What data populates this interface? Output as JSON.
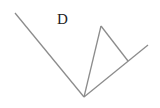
{
  "diagram": {
    "labels": [
      {
        "id": "D",
        "text": "D",
        "x": 57,
        "y": 24
      }
    ],
    "lines": [
      {
        "name": "left-ray",
        "x1": 15,
        "y1": 13,
        "x2": 84,
        "y2": 97
      },
      {
        "name": "right-ray",
        "x1": 84,
        "y1": 97,
        "x2": 148,
        "y2": 45
      },
      {
        "name": "inner-segment",
        "x1": 84,
        "y1": 97,
        "x2": 101,
        "y2": 26
      },
      {
        "name": "connector-segment",
        "x1": 101,
        "y1": 26,
        "x2": 128,
        "y2": 61
      }
    ],
    "colors": {
      "line": "#8c8c8c",
      "text": "#222222",
      "background": "#ffffff"
    }
  }
}
